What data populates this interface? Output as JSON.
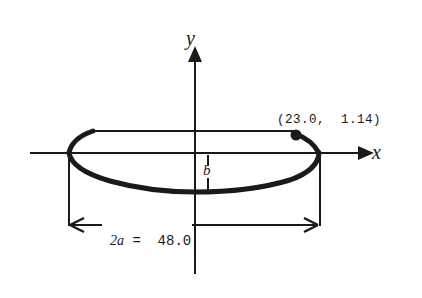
{
  "diagram": {
    "type": "ellipse-orbit-geometry",
    "axes": {
      "x_label": "x",
      "y_label": "y"
    },
    "point": {
      "label": "(23.0,  1.14)",
      "x": 23.0,
      "y": 1.14
    },
    "semi_minor": {
      "label": "b"
    },
    "major_axis": {
      "label_var": "2a",
      "label_rest": " =  48.0",
      "value": 48.0
    },
    "colors": {
      "stroke": "#1a1a1a",
      "background": "#ffffff"
    }
  }
}
